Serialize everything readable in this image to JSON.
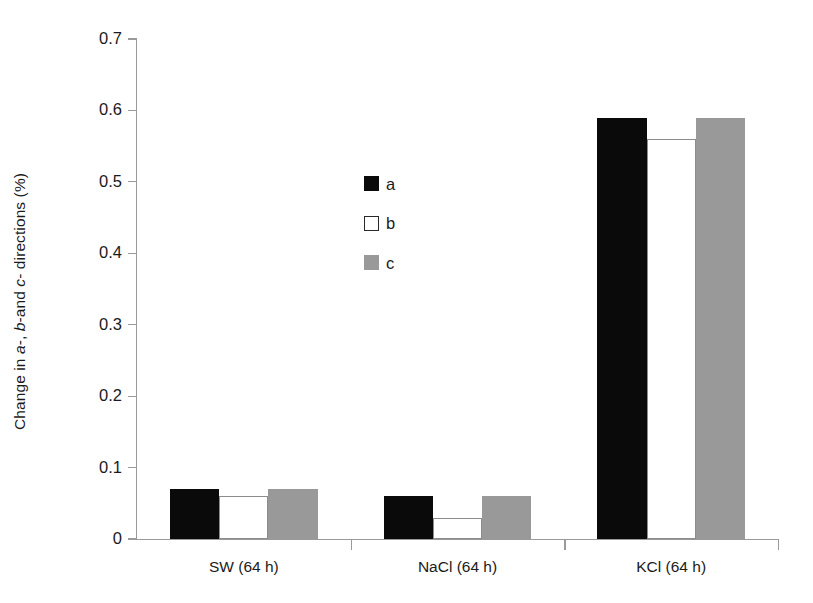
{
  "chart_data": {
    "type": "bar",
    "title": "",
    "subtitle": "",
    "xlabel": "",
    "ylabel": "Change in a-, b-and c- directions (%)",
    "ylabel_parts": [
      {
        "text": "Change in ",
        "italic": false
      },
      {
        "text": "a",
        "italic": true
      },
      {
        "text": "-, ",
        "italic": false
      },
      {
        "text": "b",
        "italic": true
      },
      {
        "text": "-and ",
        "italic": false
      },
      {
        "text": "c",
        "italic": true
      },
      {
        "text": "- directions (%)",
        "italic": false
      }
    ],
    "categories": [
      "SW (64 h)",
      "NaCl (64 h)",
      "KCl (64 h)"
    ],
    "series": [
      {
        "name": "a",
        "values": [
          0.07,
          0.06,
          0.59
        ],
        "color": "#0a0a0a"
      },
      {
        "name": "b",
        "values": [
          0.06,
          0.03,
          0.56
        ],
        "color": "#ffffff"
      },
      {
        "name": "c",
        "values": [
          0.07,
          0.06,
          0.59
        ],
        "color": "#999999"
      }
    ],
    "ylim": [
      0,
      0.7
    ],
    "ytick_values": [
      0,
      0.1,
      0.2,
      0.3,
      0.4,
      0.5,
      0.6,
      0.7
    ],
    "ytick_labels": [
      "0",
      "0.1",
      "0.2",
      "0.3",
      "0.4",
      "0.5",
      "0.6",
      "0.7"
    ],
    "grid": false,
    "legend_position": "inside-upper-center",
    "legend_entries": [
      "a",
      "b",
      "c"
    ],
    "axis_color": "#9a9a9a",
    "background": "#ffffff"
  }
}
